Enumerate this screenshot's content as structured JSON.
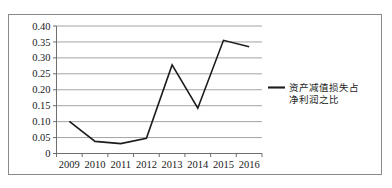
{
  "chart_data": {
    "type": "line",
    "title": "",
    "xlabel": "",
    "ylabel": "",
    "categories": [
      "2009",
      "2010",
      "2011",
      "2012",
      "2013",
      "2014",
      "2015",
      "2016"
    ],
    "series": [
      {
        "name": "资产减值损失占净利润之比",
        "values": [
          0.101,
          0.038,
          0.031,
          0.048,
          0.278,
          0.142,
          0.355,
          0.335
        ]
      }
    ],
    "ylim": [
      0,
      0.4
    ],
    "ytick_labels": [
      "0",
      "0.05",
      "0.10",
      "0.15",
      "0.20",
      "0.25",
      "0.30",
      "0.35",
      "0.40"
    ],
    "ytick_values": [
      0,
      0.05,
      0.1,
      0.15,
      0.2,
      0.25,
      0.3,
      0.35,
      0.4
    ],
    "grid": true,
    "legend_position": "right",
    "legend_entries": [
      {
        "label_line1": "资产减值损失占",
        "label_line2": "净利润之比",
        "color": "#1c1c1c"
      }
    ],
    "line_color": "#1c1c1c",
    "gridline_color": "#9a9a9a",
    "border_color": "#8a8a8a",
    "background_color": "#ffffff"
  }
}
